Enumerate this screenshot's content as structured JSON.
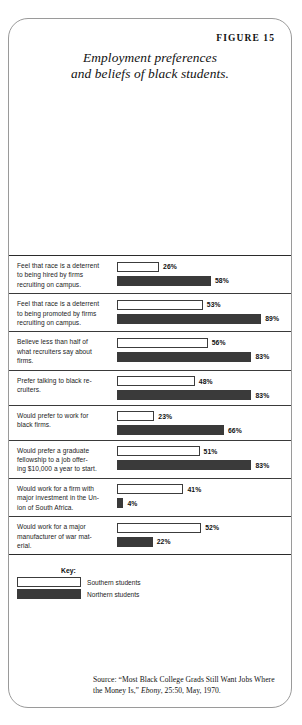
{
  "figure": {
    "number_label": "FIGURE 15",
    "title_line1": "Employment preferences",
    "title_line2": "and beliefs of black students."
  },
  "key": {
    "title": "Key:",
    "southern_label": "Southern students",
    "northern_label": "Northern students"
  },
  "source": {
    "prefix": "Source: “Most Black College Grads Still Want Jobs Where the Money Is,” ",
    "italic": "Ebony",
    "suffix": ", 25:50, May, 1970."
  },
  "rows": [
    {
      "label_l1": "Feel that race is a deterrent",
      "label_l2": "to being hired by firms",
      "label_l3": "recruiting on campus.",
      "south_text": "26%",
      "north_text": "58%"
    },
    {
      "label_l1": "Feel that race is a deterrent",
      "label_l2": "to being promoted by firms",
      "label_l3": "recruiting on campus.",
      "south_text": "53%",
      "north_text": "89%"
    },
    {
      "label_l1": "Believe less than half of",
      "label_l2": "what recruiters say about",
      "label_l3": "firms.",
      "south_text": "56%",
      "north_text": "83%"
    },
    {
      "label_l1": "Prefer talking to black re-",
      "label_l2": "cruiters.",
      "label_l3": "",
      "south_text": "48%",
      "north_text": "83%"
    },
    {
      "label_l1": "Would prefer to work for",
      "label_l2": "black firms.",
      "label_l3": "",
      "south_text": "23%",
      "north_text": "66%"
    },
    {
      "label_l1": "Would prefer a graduate",
      "label_l2": "fellowship to a job offer-",
      "label_l3": "ing $10,000 a year to start.",
      "south_text": "51%",
      "north_text": "83%"
    },
    {
      "label_l1": "Would work for a firm with",
      "label_l2": "major investment in the Un-",
      "label_l3": "ion of South Africa.",
      "south_text": "41%",
      "north_text": "4%"
    },
    {
      "label_l1": "Would work for a major",
      "label_l2": "manufacturer of war mat-",
      "label_l3": "erial.",
      "south_text": "52%",
      "north_text": "22%"
    }
  ],
  "chart_data": {
    "type": "bar",
    "orientation": "horizontal",
    "title": "Employment preferences and beliefs of black students.",
    "xlabel": "",
    "ylabel": "",
    "xlim": [
      0,
      100
    ],
    "grid": false,
    "legend_position": "bottom-left",
    "value_unit": "percent",
    "categories": [
      "Feel that race is a deterrent to being hired by firms recruiting on campus.",
      "Feel that race is a deterrent to being promoted by firms recruiting on campus.",
      "Believe less than half of what recruiters say about firms.",
      "Prefer talking to black recruiters.",
      "Would prefer to work for black firms.",
      "Would prefer a graduate fellowship to a job offering $10,000 a year to start.",
      "Would work for a firm with major investment in the Union of South Africa.",
      "Would work for a major manufacturer of war material."
    ],
    "series": [
      {
        "name": "Southern students",
        "color": "#ffffff",
        "values": [
          26,
          53,
          56,
          48,
          23,
          51,
          41,
          52
        ]
      },
      {
        "name": "Northern students",
        "color": "#3a3a3a",
        "values": [
          58,
          89,
          83,
          83,
          66,
          83,
          4,
          22
        ]
      }
    ]
  }
}
